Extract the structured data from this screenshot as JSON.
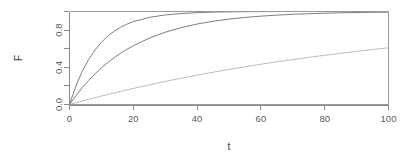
{
  "chart_data": {
    "type": "line",
    "title": "",
    "subtitle": "",
    "xlabel": "t",
    "ylabel": "F",
    "xlim": [
      0,
      100
    ],
    "ylim": [
      0.0,
      1.0
    ],
    "grid": false,
    "legend": "none",
    "x_ticks": [
      0,
      20,
      40,
      60,
      80,
      100
    ],
    "x_tick_labels": [
      "0",
      "20",
      "40",
      "60",
      "80",
      "100"
    ],
    "y_ticks": [
      0.0,
      0.2,
      0.4,
      0.6,
      0.8,
      1.0
    ],
    "y_tick_labels": [
      "0.0",
      "",
      "0.4",
      "",
      "0.8",
      ""
    ],
    "y_labeled_ticks": [
      0.0,
      0.4,
      0.8
    ],
    "x": [
      0,
      2,
      4,
      6,
      8,
      10,
      12,
      14,
      16,
      18,
      20,
      25,
      30,
      35,
      40,
      45,
      50,
      55,
      60,
      65,
      70,
      75,
      80,
      85,
      90,
      95,
      100
    ],
    "series": [
      {
        "name": "fast",
        "color": "#707070",
        "values": [
          0.0,
          0.198,
          0.357,
          0.484,
          0.586,
          0.669,
          0.735,
          0.788,
          0.83,
          0.864,
          0.891,
          0.936,
          0.963,
          0.978,
          0.988,
          0.993,
          0.996,
          0.998,
          0.999,
          0.999,
          1.0,
          1.0,
          1.0,
          1.0,
          1.0,
          1.0,
          1.0
        ]
      },
      {
        "name": "medium",
        "color": "#6e6e6e",
        "values": [
          0.0,
          0.095,
          0.181,
          0.259,
          0.33,
          0.393,
          0.451,
          0.503,
          0.551,
          0.593,
          0.632,
          0.713,
          0.777,
          0.826,
          0.865,
          0.895,
          0.918,
          0.936,
          0.95,
          0.961,
          0.97,
          0.976,
          0.982,
          0.986,
          0.989,
          0.991,
          0.993
        ]
      },
      {
        "name": "slow",
        "color": "#b4b4b4",
        "values": [
          0.0,
          0.019,
          0.037,
          0.055,
          0.073,
          0.091,
          0.108,
          0.124,
          0.141,
          0.157,
          0.173,
          0.211,
          0.248,
          0.283,
          0.316,
          0.347,
          0.377,
          0.405,
          0.433,
          0.459,
          0.483,
          0.507,
          0.529,
          0.551,
          0.571,
          0.591,
          0.61
        ]
      }
    ]
  },
  "axes": {
    "x_label": "t",
    "y_label": "F"
  }
}
